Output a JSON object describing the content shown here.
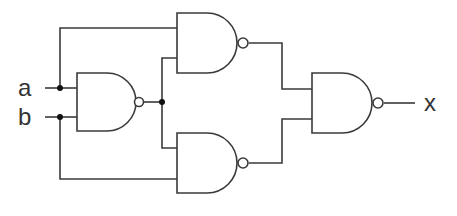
{
  "diagram": {
    "type": "logic-circuit",
    "inputs": [
      {
        "id": "a",
        "label": "a"
      },
      {
        "id": "b",
        "label": "b"
      }
    ],
    "outputs": [
      {
        "id": "x",
        "label": "x"
      }
    ],
    "gates": [
      {
        "id": "g1",
        "type": "NAND",
        "inputs": [
          "a",
          "b"
        ]
      },
      {
        "id": "g2",
        "type": "NAND",
        "inputs": [
          "a",
          "g1"
        ]
      },
      {
        "id": "g3",
        "type": "NAND",
        "inputs": [
          "g1",
          "b"
        ]
      },
      {
        "id": "g4",
        "type": "NAND",
        "inputs": [
          "g2",
          "g3"
        ],
        "output": "x"
      }
    ],
    "colors": {
      "line": "#3a3a3a",
      "junction": "#111111",
      "background": "#ffffff"
    }
  }
}
